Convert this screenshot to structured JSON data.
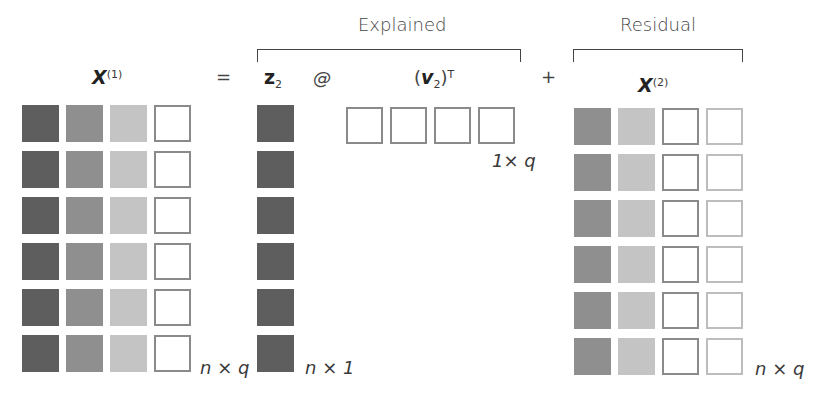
{
  "labels": {
    "explained": "Explained",
    "residual": "Residual",
    "x1_var": "X",
    "x1_sup": "(1)",
    "equals": "=",
    "z_var": "z",
    "z_sub": "2",
    "at": "@",
    "v_open": "(",
    "v_var": "v",
    "v_sub": "2",
    "v_close": ")",
    "v_sup": "T",
    "plus": "+",
    "x2_var": "X",
    "x2_sup": "(2)",
    "dim_x1": "n × q",
    "dim_z": "n × 1",
    "dim_v": "1× q",
    "dim_x2": "n × q"
  },
  "colors": {
    "dark": "#5e5e5e",
    "mid": "#8f8f8f",
    "light": "#c4c4c4",
    "outline": "#8a8a8a",
    "outline_light": "#bdbdbd"
  },
  "matrices": {
    "x1": {
      "rows": 6,
      "cols": 4,
      "col_styles": [
        "dark",
        "mid",
        "light",
        "open"
      ]
    },
    "z2": {
      "rows": 6,
      "cols": 1,
      "col_styles": [
        "dark"
      ]
    },
    "v2t": {
      "rows": 1,
      "cols": 4,
      "col_styles": [
        "open",
        "open",
        "open",
        "open"
      ]
    },
    "x2": {
      "rows": 6,
      "cols": 4,
      "col_styles": [
        "mid",
        "light",
        "open",
        "open-light"
      ]
    }
  }
}
